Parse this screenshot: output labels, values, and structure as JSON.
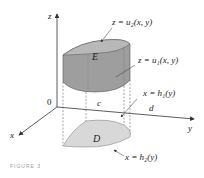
{
  "figure": {
    "axes": {
      "z": "z",
      "y": "y",
      "x": "x",
      "origin": "0"
    },
    "ticks": {
      "c": "c",
      "d": "d"
    },
    "regions": {
      "solid": "E",
      "base": "D"
    },
    "surfaces": {
      "upper": "z = u₂(x, y)",
      "lower": "z = u₁(x, y)"
    },
    "boundaries": {
      "h1": "x = h₁(y)",
      "h2": "x = h₂(y)"
    },
    "caption": "FIGURE 3",
    "colors": {
      "solid_fill": "#9e9e9e",
      "solid_top": "#b8b8b8",
      "base_fill": "#d8d8d8",
      "axis": "#333333"
    }
  }
}
